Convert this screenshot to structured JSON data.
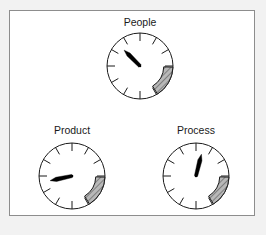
{
  "figure": {
    "name": "three-gauges-diagram",
    "background_color": "#f2f2f2",
    "panel_color": "#ffffff",
    "panel_border_color": "#8d8d8d",
    "ink_color": "#1a1a1a",
    "zone_fill_color": "#b0b0b0",
    "needle_color": "#000000"
  },
  "gauges": [
    {
      "id": "people",
      "label": "People",
      "label_x": 140,
      "label_y": 26,
      "cx": 140,
      "cy": 66,
      "radius": 33,
      "tick_count": 12,
      "tick_length": 8,
      "needle_angle_deg": 135,
      "needle_length_frac": 0.68,
      "zone_start_deg": -2,
      "zone_end_deg": -58,
      "zone_inner_frac": 0.72,
      "hatch_id": "hatch-people"
    },
    {
      "id": "product",
      "label": "Product",
      "label_x": 72,
      "label_y": 134,
      "cx": 72,
      "cy": 176,
      "radius": 33,
      "tick_count": 12,
      "tick_length": 8,
      "needle_angle_deg": 192,
      "needle_length_frac": 0.68,
      "zone_start_deg": -2,
      "zone_end_deg": -58,
      "zone_inner_frac": 0.72,
      "hatch_id": "hatch-product"
    },
    {
      "id": "process",
      "label": "Process",
      "label_x": 196,
      "label_y": 134,
      "cx": 196,
      "cy": 176,
      "radius": 33,
      "tick_count": 12,
      "tick_length": 8,
      "needle_angle_deg": 76,
      "needle_length_frac": 0.68,
      "zone_start_deg": -2,
      "zone_end_deg": -58,
      "zone_inner_frac": 0.72,
      "hatch_id": "hatch-process"
    }
  ],
  "chart_data": {
    "type": "gauge",
    "title": "",
    "categories": [
      "People",
      "Product",
      "Process"
    ],
    "series": [
      {
        "name": "Needle position (clock-angle degrees, 0 = 3 o'clock, CCW positive)",
        "values": [
          135,
          192,
          76
        ]
      }
    ],
    "target_zone": {
      "label": "hatched target band",
      "start_deg": -2,
      "end_deg": -58,
      "applies_to": [
        "People",
        "Product",
        "Process"
      ]
    },
    "dial": {
      "tick_count": 12,
      "tick_spacing_deg": 30,
      "range_deg": 360
    },
    "legend": "none",
    "grid": false
  }
}
